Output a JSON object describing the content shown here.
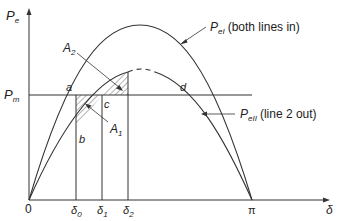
{
  "axes": {
    "y_label": "P",
    "y_label_sub": "e",
    "x_label": "δ",
    "origin": "0",
    "pi": "π"
  },
  "levels": {
    "pm_label": "P",
    "pm_sub": "m"
  },
  "curves": {
    "upper": {
      "name": "P",
      "sub": "eI",
      "desc": "(both lines in)"
    },
    "lower": {
      "name": "P",
      "sub": "eII",
      "desc": "(line 2 out)"
    }
  },
  "points": {
    "a": "a",
    "b": "b",
    "c": "c",
    "d": "d"
  },
  "areas": {
    "a1": "A",
    "a1_sub": "1",
    "a2": "A",
    "a2_sub": "2"
  },
  "angles": [
    {
      "label": "δ",
      "sub": "0"
    },
    {
      "label": "δ",
      "sub": "1"
    },
    {
      "label": "δ",
      "sub": "2"
    }
  ],
  "colors": {
    "line": "#333333",
    "hatch": "#444444"
  }
}
